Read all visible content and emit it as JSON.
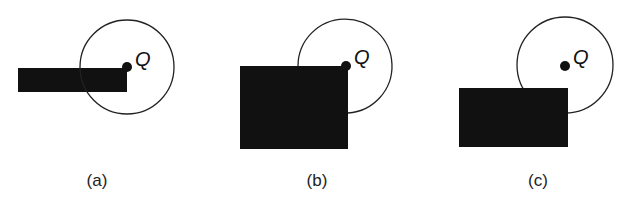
{
  "figure": {
    "panels": [
      {
        "label": "(a)",
        "point_label": "Q",
        "rect": {
          "x": 18,
          "y": 68,
          "w": 109,
          "h": 24
        },
        "circle": {
          "cx": 127,
          "cy": 67,
          "r": 47
        },
        "point": {
          "cx": 127,
          "cy": 67,
          "r": 5
        },
        "label_pos": {
          "x": 97,
          "y": 186
        },
        "q_pos": {
          "x": 135,
          "y": 66
        }
      },
      {
        "label": "(b)",
        "point_label": "Q",
        "rect": {
          "x": 240,
          "y": 66,
          "w": 108,
          "h": 83
        },
        "circle": {
          "cx": 346,
          "cy": 66,
          "r": 47
        },
        "point": {
          "cx": 346,
          "cy": 66,
          "r": 5
        },
        "label_pos": {
          "x": 317,
          "y": 186
        },
        "q_pos": {
          "x": 354,
          "y": 64
        }
      },
      {
        "label": "(c)",
        "point_label": "Q",
        "rect": {
          "x": 459,
          "y": 88,
          "w": 109,
          "h": 59
        },
        "circle": {
          "cx": 565,
          "cy": 65,
          "r": 48
        },
        "point": {
          "cx": 565,
          "cy": 66,
          "r": 5
        },
        "label_pos": {
          "x": 538,
          "y": 186
        },
        "q_pos": {
          "x": 573,
          "y": 64
        }
      }
    ],
    "colors": {
      "fill": "#111111",
      "stroke": "#222222",
      "background": "#ffffff"
    }
  }
}
